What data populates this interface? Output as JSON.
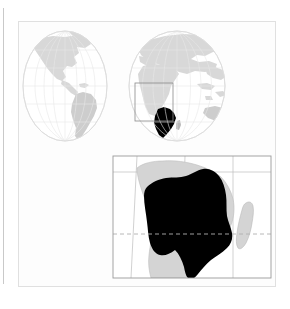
{
  "figure": {
    "kind": "locator-map",
    "title": "World locator map with southern Africa inset",
    "description": "Two-hemisphere world globes with a highlighted range in southern-central Africa, plus an enlarged inset map of the highlighted area.",
    "background_color": "#ffffff",
    "panel_background_color": "#fdfdfd",
    "panel_border_color": "#e0e0e0",
    "left_rule_color": "#c9c9c9"
  },
  "legend_colors": {
    "highlight_range": "#000000",
    "land": "#d4d4d4",
    "land_dark": "#c6c6c6",
    "ocean": "#ffffff",
    "graticule": "#e6e6e6",
    "globe_outline": "#dcdcdc",
    "locator_box": "#8a8a8a",
    "inset_frame": "#9a9a9a",
    "inset_graticule": "#b5b5b5",
    "tropic_line": "#b0b0b0",
    "coastline": "#b8b8b8"
  },
  "globes": {
    "count": 2,
    "projection": "orthographic-pair",
    "items": [
      {
        "name": "western-hemisphere",
        "label": "Western Hemisphere",
        "center_x": 64,
        "center_y": 85,
        "radius_x": 42,
        "radius_y": 55,
        "landmasses": [
          "North America",
          "South America",
          "Greenland"
        ]
      },
      {
        "name": "eastern-hemisphere",
        "label": "Eastern Hemisphere",
        "center_x": 176,
        "center_y": 85,
        "radius_x": 48,
        "radius_y": 55,
        "landmasses": [
          "Europe",
          "Asia",
          "Africa",
          "Australia"
        ]
      }
    ],
    "graticule": {
      "meridian_count": 7,
      "parallel_count": 7,
      "visible": true
    }
  },
  "locator_box": {
    "name": "locator-box",
    "label": "Inset extent on globe",
    "x": 134,
    "y": 82,
    "width": 38,
    "height": 38,
    "stroke": "#8a8a8a"
  },
  "inset": {
    "name": "inset-map",
    "label": "Southern Africa detail",
    "frame": {
      "x": 112,
      "y": 155,
      "width": 158,
      "height": 122
    },
    "frame_stroke": "#9a9a9a",
    "graticule": {
      "meridians": [
        138,
        186,
        234
      ],
      "parallels": [
        171,
        233
      ],
      "stroke": "#b5b5b5"
    },
    "tropic_line": {
      "name": "tropic-of-capricorn",
      "label": "Tropic of Capricorn",
      "y": 233,
      "style": "dashed",
      "stroke": "#b0b0b0"
    },
    "features": [
      {
        "name": "highlight-range",
        "label": "Highlighted distribution range",
        "fill": "#000000"
      },
      {
        "name": "mainland-africa",
        "label": "Mainland Africa",
        "fill": "#d4d4d4"
      },
      {
        "name": "madagascar",
        "label": "Madagascar",
        "fill": "#cfcfcf"
      }
    ]
  }
}
